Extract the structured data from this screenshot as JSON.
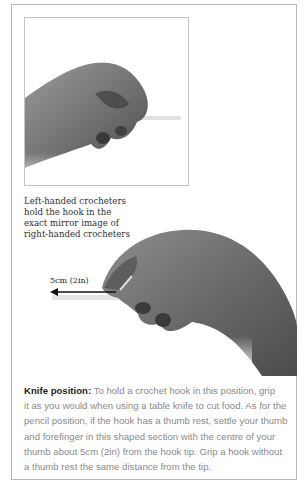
{
  "figure": {
    "top_photo": {
      "icon": "left-hand-holding-hook-image"
    },
    "bottom_photo": {
      "icon": "right-hand-knife-grip-image"
    },
    "caption_lines": [
      "Left-handed crocheters",
      "hold the hook in the",
      "exact mirror image of",
      "right-handed crocheters"
    ],
    "measurement_label": "5cm (2in)"
  },
  "description": {
    "heading": "Knife position:",
    "lines": [
      " To hold a crochet hook in this position, grip",
      "it as you would when using a table knife to cut food. As for the",
      "pencil position, if the hook has a thumb rest, settle your thumb",
      "and forefinger in this shaped section with the centre of your",
      "thumb about 5cm (2in) from the hook tip. Grip a hook without",
      "a thumb rest the same distance from the tip."
    ]
  }
}
